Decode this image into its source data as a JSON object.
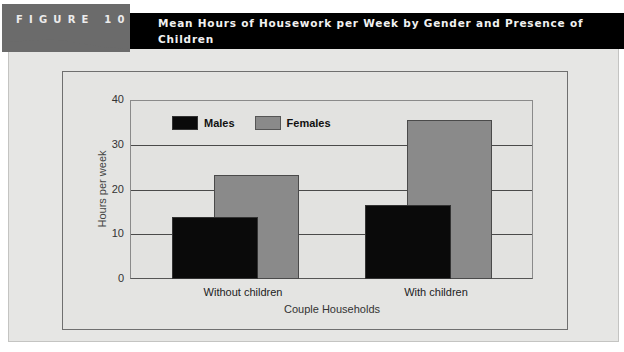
{
  "figure": {
    "label": "FIGURE 10.3",
    "title": "Mean Hours of Housework per Week by Gender and Presence of Children"
  },
  "colors": {
    "males": "#0a0a0a",
    "females": "#8a8a8a",
    "title_bar": "#000000",
    "tab": "#6b6b6b"
  },
  "chart_data": {
    "type": "bar",
    "title": "Mean Hours of Housework per Week by Gender and Presence of Children",
    "categories": [
      "Without children",
      "With children"
    ],
    "series": [
      {
        "name": "Males",
        "values": [
          13.8,
          16.5
        ]
      },
      {
        "name": "Females",
        "values": [
          23.2,
          35.5
        ]
      }
    ],
    "xlabel": "Couple Households",
    "ylabel": "Hours per week",
    "ylim": [
      0,
      40
    ],
    "yticks": [
      0,
      10,
      20,
      30,
      40
    ],
    "grid": true,
    "legend_position": "top-left inside plot"
  }
}
